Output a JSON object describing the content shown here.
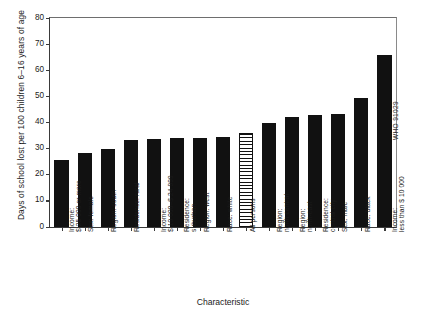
{
  "chart_data": {
    "type": "bar",
    "title": "",
    "xlabel": "Characteristic",
    "ylabel": "Days of school lost per 100  children 6–16 years of age",
    "ylim": [
      0,
      80
    ],
    "yticks": [
      0,
      10,
      20,
      30,
      40,
      50,
      60,
      70,
      80
    ],
    "grid": false,
    "legend": null,
    "categories": [
      "Income:\n$ 25 000 or more",
      "Sex: female",
      "Region: south",
      "Residence: rural",
      "Income:\n$ 10 000–$ 24 999",
      "Residence:\nsuburban",
      "Region: west",
      "Race: white",
      "All persons",
      "Region:\nnorth central",
      "Region:\nnorth-east",
      "Residence:\ncentral city",
      "Sex: male",
      "Race: black",
      "Income:\nless than $ 10 000"
    ],
    "values": [
      25.5,
      28.5,
      30.0,
      33.3,
      33.5,
      34.2,
      34.2,
      34.6,
      36.0,
      40.0,
      42.2,
      43.0,
      43.4,
      49.3,
      66.0
    ],
    "bars": [
      {
        "label_line1": "Income:",
        "label_line2": "$ 25 000 or more",
        "value": 25.5,
        "fill": "solid"
      },
      {
        "label_line1": "Sex: female",
        "label_line2": "",
        "value": 28.5,
        "fill": "solid"
      },
      {
        "label_line1": "Region: south",
        "label_line2": "",
        "value": 30.0,
        "fill": "solid"
      },
      {
        "label_line1": "Residence: rural",
        "label_line2": "",
        "value": 33.3,
        "fill": "solid"
      },
      {
        "label_line1": "Income:",
        "label_line2": "$ 10 000–$ 24 999",
        "value": 33.5,
        "fill": "solid"
      },
      {
        "label_line1": "Residence:",
        "label_line2": "suburban",
        "value": 34.2,
        "fill": "solid"
      },
      {
        "label_line1": "Region: west",
        "label_line2": "",
        "value": 34.2,
        "fill": "solid"
      },
      {
        "label_line1": "Race: white",
        "label_line2": "",
        "value": 34.6,
        "fill": "solid"
      },
      {
        "label_line1": "All persons",
        "label_line2": "",
        "value": 36.0,
        "fill": "hatched"
      },
      {
        "label_line1": "Region:",
        "label_line2": "north central",
        "value": 40.0,
        "fill": "solid"
      },
      {
        "label_line1": "Region:",
        "label_line2": "north-east",
        "value": 42.2,
        "fill": "solid"
      },
      {
        "label_line1": "Residence:",
        "label_line2": "central city",
        "value": 43.0,
        "fill": "solid"
      },
      {
        "label_line1": "Sex: male",
        "label_line2": "",
        "value": 43.4,
        "fill": "solid"
      },
      {
        "label_line1": "Race: black",
        "label_line2": "",
        "value": 49.3,
        "fill": "solid"
      },
      {
        "label_line1": "Income:",
        "label_line2": "less than $ 10 000",
        "value": 66.0,
        "fill": "solid"
      }
    ],
    "colors": {
      "bar_solid": "#111111",
      "bar_hatch_line": "#111111",
      "bar_hatch_background": "#ffffff",
      "axis": "#3a3a3a",
      "text": "#1a1a1a",
      "background": "#ffffff"
    }
  },
  "credit": {
    "text": "WHO 91029"
  }
}
